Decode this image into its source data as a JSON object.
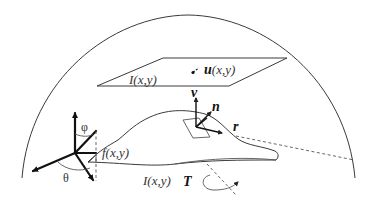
{
  "diagram": {
    "labels": {
      "image_plane": "I(x,y)",
      "flow": "u(x,y)",
      "surface": "f(x,y)",
      "irradiance": "I(x,y)",
      "view_vector": "v",
      "normal_vector": "n",
      "reflect_vector": "r",
      "translation": "T",
      "phi": "φ",
      "theta": "θ"
    },
    "colors": {
      "line": "#3a3a3a",
      "axis": "#111111",
      "background": "#ffffff"
    }
  }
}
